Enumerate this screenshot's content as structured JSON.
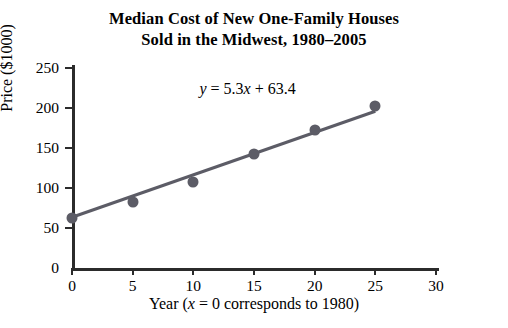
{
  "chart_data": {
    "type": "scatter",
    "title_line1": "Median Cost of New One-Family Houses",
    "title_line2": "Sold in the Midwest, 1980–2005",
    "xlabel_prefix": "Year (",
    "xlabel_var": "x",
    "xlabel_suffix": " = 0 corresponds to 1980)",
    "ylabel": "Price ($1000)",
    "xticks": [
      "0",
      "5",
      "10",
      "15",
      "20",
      "25",
      "30"
    ],
    "xtick_values": [
      0,
      5,
      10,
      15,
      20,
      25,
      30
    ],
    "yticks": [
      "0",
      "50",
      "100",
      "150",
      "200",
      "250"
    ],
    "ytick_values": [
      0,
      50,
      100,
      150,
      200,
      250
    ],
    "xlim": [
      0,
      30
    ],
    "ylim": [
      0,
      250
    ],
    "grid": false,
    "legend": "none",
    "points": [
      {
        "x": 0,
        "y": 63
      },
      {
        "x": 5,
        "y": 82
      },
      {
        "x": 10,
        "y": 107
      },
      {
        "x": 15,
        "y": 142
      },
      {
        "x": 20,
        "y": 172
      },
      {
        "x": 25,
        "y": 202
      }
    ],
    "series": [
      {
        "name": "Median price",
        "x": [
          0,
          5,
          10,
          15,
          20,
          25
        ],
        "values": [
          63,
          82,
          107,
          142,
          172,
          202
        ]
      }
    ],
    "trendline": {
      "equation_y": "y",
      "equation_eq": " = 5.3",
      "equation_x": "x",
      "equation_rest": " + 63.4",
      "slope": 5.3,
      "intercept": 63.4,
      "x_start": 0,
      "x_end": 25,
      "color": "#5c5c66"
    },
    "point_color": "#5c5c66",
    "axis_color": "#2b2b2b"
  }
}
